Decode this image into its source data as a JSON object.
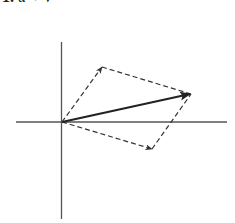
{
  "caption": {
    "number": "1.",
    "expression": "u + v"
  },
  "diagram": {
    "type": "vector-addition-parallelogram",
    "colors": {
      "axis": "#555555",
      "dashed": "#333333",
      "resultant": "#222222",
      "background": "#ffffff"
    },
    "origin_px": [
      62,
      122
    ],
    "axes": {
      "horizontal_px": [
        16,
        227
      ],
      "vertical_px": [
        42,
        219
      ]
    },
    "vectors": [
      {
        "name": "upper-vector",
        "style": "dashed",
        "tip_px": [
          102,
          67
        ]
      },
      {
        "name": "lower-vector",
        "style": "dashed",
        "tip_px": [
          152,
          149
        ]
      },
      {
        "name": "resultant-vector",
        "style": "solid-bold",
        "tip_px": [
          191,
          94
        ]
      }
    ]
  }
}
